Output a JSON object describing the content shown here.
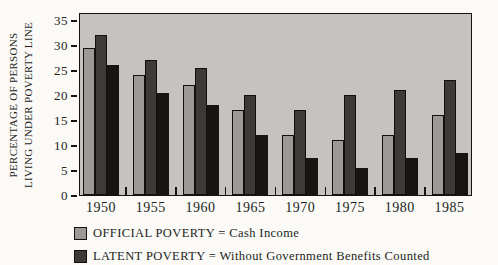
{
  "figure": {
    "background_color": "#fbfaf7",
    "plot_background_color": "#c4c3c0",
    "axis_color": "#15130f"
  },
  "axis": {
    "y_title_line1": "PERCENTAGE OF PERSONS",
    "y_title_line2": "LIVING UNDER POVERTY LINE",
    "x_tick_labels": [
      "1950",
      "1955",
      "1960",
      "1965",
      "1970",
      "1975",
      "1980",
      "1985"
    ],
    "y_tick_labels": [
      "0",
      "5",
      "10",
      "15",
      "20",
      "25",
      "30",
      "35"
    ]
  },
  "chart_data": {
    "type": "bar",
    "title": "",
    "xlabel": "",
    "ylabel": "PERCENTAGE OF PERSONS LIVING UNDER POVERTY LINE",
    "ylim": [
      0,
      35
    ],
    "ytick_step": 5,
    "yticks": [
      0,
      5,
      10,
      15,
      20,
      25,
      30,
      35
    ],
    "grid": false,
    "legend_position": "bottom-left",
    "categories": [
      "1950",
      "1955",
      "1960",
      "1965",
      "1970",
      "1975",
      "1980",
      "1985"
    ],
    "series": [
      {
        "name": "OFFICIAL POVERTY = Cash Income",
        "color": "#9b9a97",
        "legend_visible": true,
        "values": [
          29.5,
          24,
          22,
          17,
          12,
          11,
          12,
          16
        ]
      },
      {
        "name": "LATENT POVERTY = Without Government Benefits Counted",
        "color": "#3c3b39",
        "legend_visible": true,
        "values": [
          32,
          27,
          25.5,
          20,
          17,
          20,
          21,
          23
        ]
      },
      {
        "name": "",
        "color": "#161513",
        "legend_visible": false,
        "values": [
          26,
          20.5,
          18,
          12,
          7.5,
          5.5,
          7.5,
          8.5
        ]
      }
    ]
  },
  "legend": {
    "items": [
      {
        "label": "OFFICIAL POVERTY = Cash Income",
        "color": "#9b9a97"
      },
      {
        "label": "LATENT POVERTY = Without Government Benefits Counted",
        "color": "#3c3b39"
      }
    ]
  }
}
